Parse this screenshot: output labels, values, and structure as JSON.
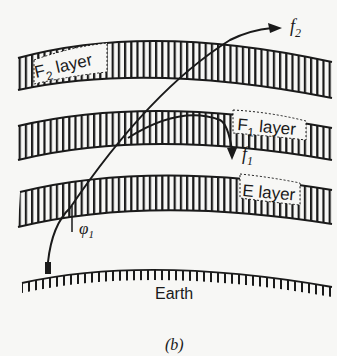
{
  "diagram": {
    "type": "ionospheric-propagation",
    "caption": "(b)",
    "layers": [
      {
        "id": "f2",
        "label_main": "F",
        "label_sub": "2",
        "label_rest": " layer"
      },
      {
        "id": "f1",
        "label_main": "F",
        "label_sub": "1",
        "label_rest": " layer"
      },
      {
        "id": "e",
        "label_main": "E layer"
      }
    ],
    "ground": {
      "label": "Earth"
    },
    "rays": [
      {
        "id": "f2",
        "label": "f",
        "sub": "2",
        "behavior": "penetrates all layers"
      },
      {
        "id": "f1",
        "label": "f",
        "sub": "1",
        "behavior": "reflected by F1 layer"
      }
    ],
    "angle": {
      "symbol": "φ",
      "sub": "1"
    },
    "colors": {
      "ink": "#1a1a1a",
      "paper": "#f7f7f5"
    }
  }
}
